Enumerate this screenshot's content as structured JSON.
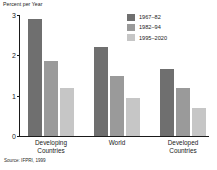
{
  "chart_data": {
    "type": "bar",
    "title": "",
    "xlabel": "",
    "ylabel": "Percent per Year",
    "ylim": [
      0,
      3
    ],
    "yticks": [
      0,
      1,
      2,
      3
    ],
    "ytick_labels": [
      "0",
      "1",
      "2",
      "3"
    ],
    "grid": false,
    "legend_position": "top-right",
    "categories": [
      "Developing\nCountries",
      "World",
      "Developed\nCountries"
    ],
    "series": [
      {
        "name": "1967–82",
        "color": "#6f6f6f",
        "values": [
          2.9,
          2.2,
          1.65
        ]
      },
      {
        "name": "1982–94",
        "color": "#9a9a9a",
        "values": [
          1.85,
          1.5,
          1.2
        ]
      },
      {
        "name": "1995–2020",
        "color": "#c6c6c6",
        "values": [
          1.2,
          0.95,
          0.7
        ]
      }
    ],
    "source": "Source: IFPRI, 1999"
  }
}
